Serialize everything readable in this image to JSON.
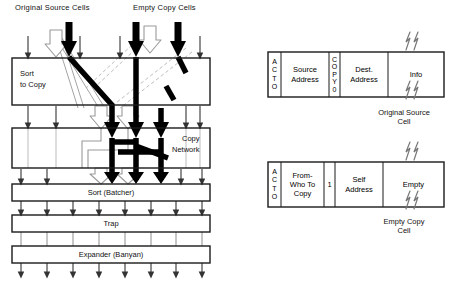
{
  "figure": {
    "top_labels": [
      {
        "text": "Original Source Cells",
        "x": 15,
        "y": 3
      },
      {
        "text": "Empty Copy Cells",
        "x": 133,
        "y": 3
      }
    ],
    "stages": [
      {
        "name": "sort-to-copy",
        "label_lines": [
          "Sort",
          "to Copy"
        ],
        "x": 12,
        "y": 58,
        "w": 198,
        "h": 47,
        "label_x": 20,
        "label_y": 68,
        "label_align": "left"
      },
      {
        "name": "copy-network",
        "label_lines": [
          "Copy",
          "Network"
        ],
        "x": 12,
        "y": 128,
        "w": 198,
        "h": 40,
        "label_x": 172,
        "label_y": 134,
        "label_align": "right"
      },
      {
        "name": "sort-batcher",
        "label_lines": [
          "Sort (Batcher)"
        ],
        "x": 12,
        "y": 184,
        "w": 198,
        "h": 17,
        "label_x": 111,
        "label_y": 188,
        "label_align": "center"
      },
      {
        "name": "trap",
        "label_lines": [
          "Trap"
        ],
        "x": 12,
        "y": 215,
        "w": 198,
        "h": 17,
        "label_x": 111,
        "label_y": 219,
        "label_align": "center"
      },
      {
        "name": "expander-banyan",
        "label_lines": [
          "Expander (Banyan)"
        ],
        "x": 12,
        "y": 246,
        "w": 198,
        "h": 17,
        "label_x": 111,
        "label_y": 250,
        "label_align": "center"
      }
    ],
    "line_colors": {
      "box_stroke": "#1a1a1a",
      "thin_arrow": "#444444",
      "thick_arrow": "#000000",
      "hollow_arrow_stroke": "#9a9a9a",
      "hollow_arrow_fill": "#ffffff",
      "dashed_gray": "#b0b0b0",
      "text": "#111111"
    }
  },
  "cells": [
    {
      "name": "original-source-cell",
      "caption_lines": [
        "Original Source",
        "Cell"
      ],
      "caption_x": 352,
      "caption_y": 108,
      "caption_w": 104,
      "box": {
        "x": 268,
        "y": 52,
        "w": 176,
        "h": 45
      },
      "fields": [
        {
          "id": "acto",
          "orientation": "vertical",
          "text": "ACTO",
          "letters": [
            "A",
            "C",
            "T",
            "O"
          ],
          "w": 13
        },
        {
          "id": "source-address",
          "orientation": "horizontal",
          "lines": [
            "Source",
            "Address"
          ],
          "w": 48
        },
        {
          "id": "copy0",
          "orientation": "vertical",
          "text": "COPY0",
          "letters": [
            "C",
            "O",
            "P",
            "Y",
            "0"
          ],
          "w": 11
        },
        {
          "id": "dest-address",
          "orientation": "horizontal",
          "lines": [
            "Dest.",
            "Address"
          ],
          "w": 48
        },
        {
          "id": "info",
          "orientation": "horizontal",
          "lines": [
            "Info"
          ],
          "w": 56
        }
      ],
      "break_marks": [
        {
          "x": 404,
          "y": 36
        },
        {
          "x": 404,
          "y": 88
        }
      ]
    },
    {
      "name": "empty-copy-cell",
      "caption_lines": [
        "Empty Copy",
        "Cell"
      ],
      "caption_x": 352,
      "caption_y": 217,
      "caption_w": 104,
      "box": {
        "x": 268,
        "y": 162,
        "w": 176,
        "h": 45
      },
      "fields": [
        {
          "id": "acto",
          "orientation": "vertical",
          "text": "ACTO",
          "letters": [
            "A",
            "C",
            "T",
            "O"
          ],
          "w": 13
        },
        {
          "id": "from-who-to-copy",
          "orientation": "horizontal",
          "lines": [
            "From-",
            "Who To",
            "Copy"
          ],
          "w": 43
        },
        {
          "id": "one-bit",
          "orientation": "horizontal",
          "lines": [
            "1"
          ],
          "w": 11
        },
        {
          "id": "self-address",
          "orientation": "horizontal",
          "lines": [
            "Self",
            "Address"
          ],
          "w": 48
        },
        {
          "id": "empty",
          "orientation": "horizontal",
          "lines": [
            "Empty"
          ],
          "w": 61
        }
      ],
      "break_marks": [
        {
          "x": 404,
          "y": 146
        },
        {
          "x": 404,
          "y": 198
        }
      ]
    }
  ]
}
